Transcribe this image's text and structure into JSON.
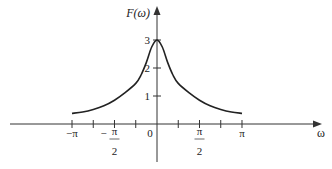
{
  "chart_data": {
    "type": "line",
    "title": "",
    "xlabel": "ω",
    "ylabel": "F(ω)",
    "xlim": [
      -3.6,
      6.8
    ],
    "ylim": [
      0,
      3.5
    ],
    "grid": false,
    "legend": null,
    "x_ticks": [
      {
        "value": -3.14159,
        "label": "−π"
      },
      {
        "value": -2.35619,
        "label": ""
      },
      {
        "value": -1.5708,
        "label": "−π/2",
        "num": "π",
        "den": "2",
        "sign": "−"
      },
      {
        "value": -0.7854,
        "label": ""
      },
      {
        "value": 0,
        "label": "0"
      },
      {
        "value": 0.7854,
        "label": ""
      },
      {
        "value": 1.5708,
        "label": "π/2",
        "num": "π",
        "den": "2",
        "sign": ""
      },
      {
        "value": 2.35619,
        "label": ""
      },
      {
        "value": 3.14159,
        "label": "π"
      }
    ],
    "y_ticks": [
      {
        "value": 1,
        "label": "1"
      },
      {
        "value": 2,
        "label": "2"
      },
      {
        "value": 3,
        "label": "3"
      }
    ],
    "series": [
      {
        "name": "F(ω)",
        "x": [
          -3.1416,
          -2.7489,
          -2.3562,
          -1.9635,
          -1.5708,
          -1.1781,
          -0.7854,
          -0.589,
          -0.3927,
          -0.1963,
          0,
          0.1963,
          0.3927,
          0.589,
          0.7854,
          1.1781,
          1.5708,
          1.9635,
          2.3562,
          2.7489,
          3.1416
        ],
        "y": [
          0.38,
          0.43,
          0.52,
          0.65,
          0.85,
          1.12,
          1.45,
          1.75,
          2.2,
          2.75,
          3.0,
          2.75,
          2.2,
          1.75,
          1.45,
          1.12,
          0.85,
          0.65,
          0.52,
          0.43,
          0.38
        ]
      }
    ],
    "annotations": []
  },
  "labels": {
    "y_axis": "F(ω)",
    "x_axis": "ω",
    "origin": "0"
  }
}
